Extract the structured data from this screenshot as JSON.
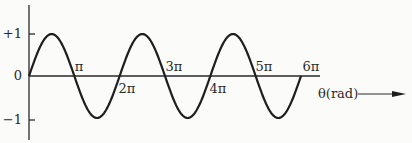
{
  "chart_data": {
    "type": "line",
    "title": "",
    "xlabel": "θ(rad)",
    "ylabel": "",
    "function": "sin(θ)",
    "x_range": [
      0,
      18.85
    ],
    "ylim": [
      -1,
      1
    ],
    "grid": false,
    "legend": null,
    "y_ticks": [
      {
        "value": 1,
        "label": "+1"
      },
      {
        "value": 0,
        "label": "0"
      },
      {
        "value": -1,
        "label": "−1"
      }
    ],
    "x_ticks": [
      {
        "value": 3.1416,
        "label": "π"
      },
      {
        "value": 6.2832,
        "label": "2π"
      },
      {
        "value": 9.4248,
        "label": "3π"
      },
      {
        "value": 12.5664,
        "label": "4π"
      },
      {
        "value": 15.708,
        "label": "5π"
      },
      {
        "value": 18.8496,
        "label": "6π"
      }
    ],
    "series": [
      {
        "name": "sin θ",
        "x": [
          0,
          1.5708,
          3.1416,
          4.7124,
          6.2832,
          7.854,
          9.4248,
          10.9956,
          12.5664,
          14.1372,
          15.708,
          17.2788,
          18.8496
        ],
        "values": [
          0,
          1,
          0,
          -1,
          0,
          1,
          0,
          -1,
          0,
          1,
          0,
          -1,
          0
        ]
      }
    ]
  },
  "axis": {
    "x_label": "θ(rad)",
    "y_labels": {
      "plus_one": "+1",
      "zero": "0",
      "minus_one": "−1"
    },
    "x_tick_labels": {
      "pi": "π",
      "two_pi": "2π",
      "three_pi": "3π",
      "four_pi": "4π",
      "five_pi": "5π",
      "six_pi": "6π"
    }
  }
}
